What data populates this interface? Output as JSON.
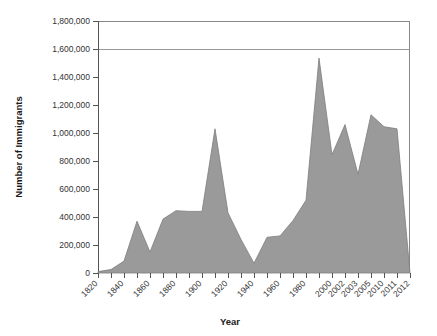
{
  "chart_data": {
    "type": "area",
    "title": "",
    "xlabel": "Year",
    "ylabel": "Number of Immigrants",
    "ylim": [
      0,
      1800000
    ],
    "grid": true,
    "legend": null,
    "y_ticks": [
      "0",
      "200,000",
      "400,000",
      "600,000",
      "800,000",
      "1,000,000",
      "1,200,000",
      "1,400,000",
      "1,600,000",
      "1,800,000"
    ],
    "y_tick_values": [
      0,
      200000,
      400000,
      600000,
      800000,
      1000000,
      1200000,
      1400000,
      1600000,
      1800000
    ],
    "x_tick_labels": [
      "1820",
      "",
      "1840",
      "",
      "1860",
      "",
      "1880",
      "",
      "1900",
      "",
      "1920",
      "",
      "1940",
      "",
      "1960",
      "",
      "1980",
      "",
      "2000",
      "2002",
      "2003",
      "2005",
      "2010",
      "2011",
      "2012"
    ],
    "categories": [
      "1820",
      "1830",
      "1840",
      "1850",
      "1860",
      "1870",
      "1880",
      "1890",
      "1900",
      "1910",
      "1920",
      "1930",
      "1940",
      "1950",
      "1960",
      "1970",
      "1980",
      "1991",
      "2000",
      "2002",
      "2003",
      "2005",
      "2010",
      "2011",
      "2012"
    ],
    "values": [
      10000,
      25000,
      85000,
      370000,
      150000,
      385000,
      445000,
      440000,
      440000,
      1030000,
      430000,
      240000,
      70000,
      255000,
      265000,
      375000,
      520000,
      1535000,
      845000,
      1060000,
      705000,
      1130000,
      1045000,
      1030000,
      0
    ],
    "series": [
      {
        "name": "Number of Immigrants",
        "color": "#9a9a9a",
        "values": [
          10000,
          25000,
          85000,
          370000,
          150000,
          385000,
          445000,
          440000,
          440000,
          1030000,
          430000,
          240000,
          70000,
          255000,
          265000,
          375000,
          520000,
          1535000,
          845000,
          1060000,
          705000,
          1130000,
          1045000,
          1030000,
          0
        ]
      }
    ],
    "annotations": []
  },
  "colors": {
    "area_fill": "#9a9a9a",
    "area_stroke": "#7d7d7d",
    "axis": "#555555",
    "grid": "#999999",
    "text": "#333333"
  }
}
